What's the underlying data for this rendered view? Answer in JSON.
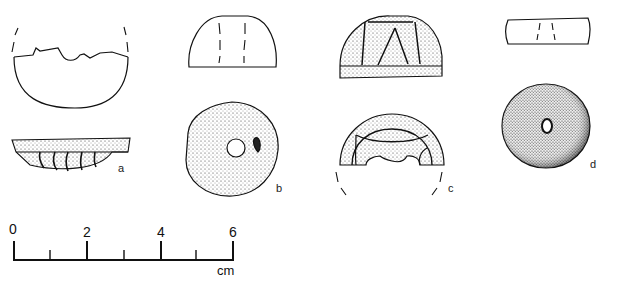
{
  "figure": {
    "artifacts": [
      {
        "id": "a",
        "label": "a",
        "views": [
          "top-outline",
          "side-profile"
        ]
      },
      {
        "id": "b",
        "label": "b",
        "views": [
          "side-outline",
          "top-view-perforated"
        ]
      },
      {
        "id": "c",
        "label": "c",
        "views": [
          "side-view",
          "top-view-reconstructed"
        ]
      },
      {
        "id": "d",
        "label": "d",
        "views": [
          "side-outline",
          "top-view-perforated"
        ]
      }
    ],
    "scale_bar": {
      "ticks": [
        "0",
        "2",
        "4",
        "6"
      ],
      "unit": "cm"
    }
  }
}
